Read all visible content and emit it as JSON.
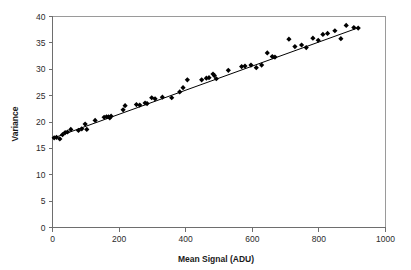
{
  "chart_data": {
    "type": "scatter",
    "title": "",
    "xlabel": "Mean Signal (ADU)",
    "ylabel": "Variance",
    "xlim": [
      0,
      1000
    ],
    "ylim": [
      0,
      40
    ],
    "xticks": [
      0,
      200,
      400,
      600,
      800,
      1000
    ],
    "yticks": [
      0,
      5,
      10,
      15,
      20,
      25,
      30,
      35,
      40
    ],
    "grid": false,
    "legend": null,
    "marker_style": "filled-diamond",
    "marker_color": "#000000",
    "series": [
      {
        "name": "Mean-Variance measurements",
        "points": [
          [
            5,
            17.0
          ],
          [
            12,
            17.1
          ],
          [
            22,
            16.8
          ],
          [
            30,
            17.6
          ],
          [
            38,
            18.0
          ],
          [
            45,
            18.1
          ],
          [
            55,
            18.6
          ],
          [
            78,
            18.4
          ],
          [
            88,
            18.7
          ],
          [
            98,
            19.6
          ],
          [
            103,
            18.6
          ],
          [
            128,
            20.3
          ],
          [
            155,
            20.9
          ],
          [
            162,
            21.0
          ],
          [
            168,
            21.0
          ],
          [
            172,
            20.8
          ],
          [
            176,
            21.1
          ],
          [
            212,
            22.3
          ],
          [
            218,
            23.1
          ],
          [
            252,
            23.3
          ],
          [
            262,
            23.2
          ],
          [
            278,
            23.6
          ],
          [
            284,
            23.5
          ],
          [
            298,
            24.6
          ],
          [
            308,
            24.4
          ],
          [
            330,
            24.7
          ],
          [
            358,
            24.6
          ],
          [
            382,
            25.7
          ],
          [
            392,
            26.5
          ],
          [
            405,
            28.0
          ],
          [
            448,
            28.0
          ],
          [
            462,
            28.3
          ],
          [
            470,
            28.4
          ],
          [
            482,
            29.1
          ],
          [
            486,
            28.8
          ],
          [
            492,
            28.2
          ],
          [
            528,
            29.8
          ],
          [
            568,
            30.5
          ],
          [
            578,
            30.6
          ],
          [
            596,
            30.8
          ],
          [
            612,
            30.3
          ],
          [
            628,
            30.8
          ],
          [
            645,
            33.1
          ],
          [
            660,
            32.4
          ],
          [
            668,
            32.3
          ],
          [
            710,
            35.7
          ],
          [
            728,
            34.3
          ],
          [
            748,
            34.6
          ],
          [
            762,
            34.1
          ],
          [
            782,
            35.9
          ],
          [
            798,
            35.5
          ],
          [
            812,
            36.6
          ],
          [
            826,
            36.8
          ],
          [
            848,
            37.3
          ],
          [
            866,
            35.8
          ],
          [
            882,
            38.3
          ],
          [
            905,
            37.9
          ],
          [
            918,
            37.8
          ]
        ]
      }
    ],
    "fit_line": {
      "name": "linear fit",
      "x_start": 0,
      "y_start": 16.9,
      "x_end": 920,
      "y_end": 37.9
    }
  },
  "axes": {
    "x_tick_labels": [
      "0",
      "200",
      "400",
      "600",
      "800",
      "1000"
    ],
    "y_tick_labels": [
      "0",
      "5",
      "10",
      "15",
      "20",
      "25",
      "30",
      "35",
      "40"
    ],
    "x_title": "Mean Signal (ADU)",
    "y_title": "Variance"
  },
  "colors": {
    "background": "#ffffff",
    "marker": "#000000",
    "line": "#000000",
    "frame": "#9a9a9a",
    "axis": "#6e6e6e",
    "text": "#2b2b2b"
  }
}
